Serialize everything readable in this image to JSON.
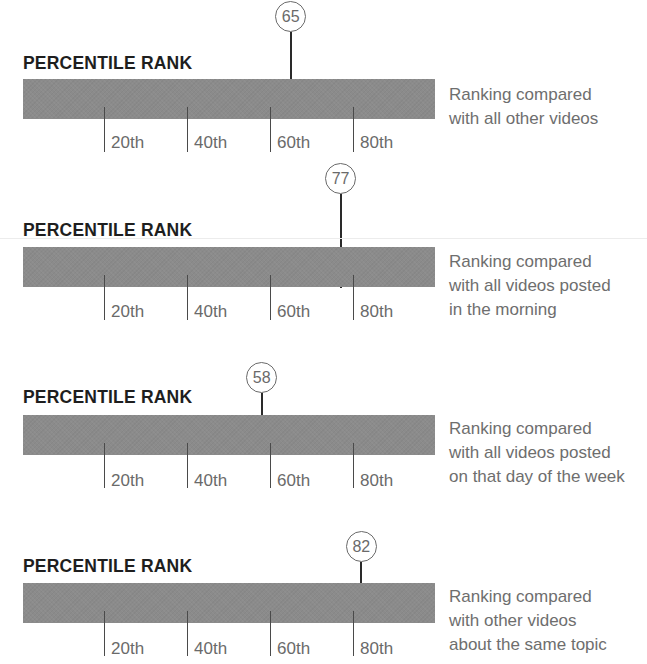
{
  "colors": {
    "bar": "#8b8b8b",
    "marker_stem": "#2a2a2a",
    "tick": "#4a4a4a",
    "text_title": "#1e1e1e",
    "text_secondary": "#6a6a6a"
  },
  "scale": {
    "x0": 21,
    "px_per_unit": 4.15
  },
  "sections": [
    {
      "title": "PERCENTILE RANK",
      "value": 65,
      "value_label": "65",
      "description": [
        "Ranking compared",
        "with all other videos"
      ],
      "ticks": [
        "20th",
        "40th",
        "60th",
        "80th"
      ]
    },
    {
      "title": "PERCENTILE RANK",
      "value": 77,
      "value_label": "77",
      "description": [
        "Ranking compared",
        "with all videos posted",
        "in the morning"
      ],
      "ticks": [
        "20th",
        "40th",
        "60th",
        "80th"
      ]
    },
    {
      "title": "PERCENTILE RANK",
      "value": 58,
      "value_label": "58",
      "description": [
        "Ranking compared",
        "with all videos posted",
        "on that day of the week"
      ],
      "ticks": [
        "20th",
        "40th",
        "60th",
        "80th"
      ]
    },
    {
      "title": "PERCENTILE RANK",
      "value": 82,
      "value_label": "82",
      "description": [
        "Ranking compared",
        "with other videos",
        "about the same topic"
      ],
      "ticks": [
        "20th",
        "40th",
        "60th",
        "80th"
      ]
    }
  ],
  "chart_data": [
    {
      "type": "bar",
      "title": "PERCENTILE RANK",
      "subtitle": "Ranking compared with all other videos",
      "xlabel": "",
      "ylabel": "",
      "xlim": [
        0,
        100
      ],
      "tick_labels": [
        "20th",
        "40th",
        "60th",
        "80th"
      ],
      "tick_values": [
        20,
        40,
        60,
        80
      ],
      "marker_value": 65,
      "grid": false,
      "legend": null
    },
    {
      "type": "bar",
      "title": "PERCENTILE RANK",
      "subtitle": "Ranking compared with all videos posted in the morning",
      "xlabel": "",
      "ylabel": "",
      "xlim": [
        0,
        100
      ],
      "tick_labels": [
        "20th",
        "40th",
        "60th",
        "80th"
      ],
      "tick_values": [
        20,
        40,
        60,
        80
      ],
      "marker_value": 77,
      "grid": false,
      "legend": null
    },
    {
      "type": "bar",
      "title": "PERCENTILE RANK",
      "subtitle": "Ranking compared with all videos posted on that day of the week",
      "xlabel": "",
      "ylabel": "",
      "xlim": [
        0,
        100
      ],
      "tick_labels": [
        "20th",
        "40th",
        "60th",
        "80th"
      ],
      "tick_values": [
        20,
        40,
        60,
        80
      ],
      "marker_value": 58,
      "grid": false,
      "legend": null
    },
    {
      "type": "bar",
      "title": "PERCENTILE RANK",
      "subtitle": "Ranking compared with other videos about the same topic",
      "xlabel": "",
      "ylabel": "",
      "xlim": [
        0,
        100
      ],
      "tick_labels": [
        "20th",
        "40th",
        "60th",
        "80th"
      ],
      "tick_values": [
        20,
        40,
        60,
        80
      ],
      "marker_value": 82,
      "grid": false,
      "legend": null
    }
  ]
}
